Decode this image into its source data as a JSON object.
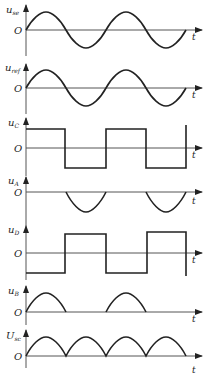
{
  "diagram": {
    "type": "waveform_timing_diagram",
    "x_axis_label": "t",
    "origin_label": "O",
    "panels": [
      {
        "id": "use",
        "ylabel_main": "u",
        "ylabel_sub": "se",
        "waveform": "sine",
        "description": "input sine wave, 2 full periods"
      },
      {
        "id": "uref",
        "ylabel_main": "u",
        "ylabel_sub": "ref",
        "waveform": "sine",
        "description": "reference sine wave in phase with u_se"
      },
      {
        "id": "uC",
        "ylabel_main": "u",
        "ylabel_sub": "C",
        "waveform": "square",
        "description": "square wave, high during positive half-cycles"
      },
      {
        "id": "uA",
        "ylabel_main": "u",
        "ylabel_sub": "A",
        "waveform": "negative_half_sine",
        "description": "only negative half-cycles present"
      },
      {
        "id": "uD",
        "ylabel_main": "u",
        "ylabel_sub": "D",
        "waveform": "square_inverted",
        "description": "square wave, high during negative half-cycles"
      },
      {
        "id": "uB",
        "ylabel_main": "u",
        "ylabel_sub": "B",
        "waveform": "positive_half_sine",
        "description": "only positive half-cycles present"
      },
      {
        "id": "Usc",
        "ylabel_main": "U",
        "ylabel_sub": "sc",
        "waveform": "full_wave_rectified",
        "description": "full-wave rectified output, 4 humps"
      }
    ]
  }
}
